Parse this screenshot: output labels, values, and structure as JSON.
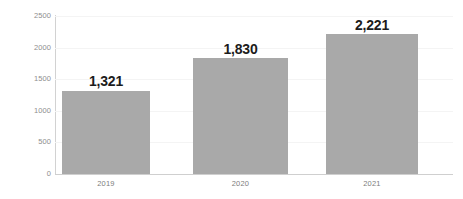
{
  "chart_data": {
    "type": "bar",
    "title": "",
    "subtitle": "",
    "xlabel": "",
    "ylabel": "",
    "categories": [
      "2019",
      "2020",
      "2021"
    ],
    "values": [
      1321,
      1830,
      2221
    ],
    "value_labels": [
      "1,321",
      "1,830",
      "2,221"
    ],
    "series": [
      {
        "name": "",
        "values": [
          1321,
          1830,
          2221
        ]
      }
    ],
    "ylim": [
      0,
      2500
    ],
    "y_ticks": [
      0,
      500,
      1000,
      1500,
      2000,
      2500
    ],
    "y_tick_labels": [
      "0",
      "500",
      "1000",
      "1500",
      "2000",
      "2500"
    ],
    "grid": true,
    "grid_axis": "y",
    "legend": false,
    "legend_position": "none",
    "bar_color": "#a9a9a9",
    "axis_color": "#d2d2d2",
    "grid_color": "#f4f4f4",
    "tick_label_color": "#8e8e8e",
    "value_label_color": "#1c1c1c",
    "background_color": "#ffffff"
  }
}
